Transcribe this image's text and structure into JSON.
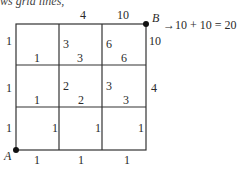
{
  "header_text": "ws grid lines,",
  "points": {
    "start": "A",
    "end": "B"
  },
  "result_text": "→10 + 10 = 20",
  "top_edge_labels": [
    "4",
    "10"
  ],
  "right_edge_labels": [
    "10",
    "4"
  ],
  "left_edge_labels": [
    "1",
    "1",
    "1"
  ],
  "bottom_edge_labels": [
    "1",
    "1",
    "1"
  ],
  "row1": {
    "vertical": [
      "3",
      "6"
    ],
    "horizontal": [
      "1",
      "3",
      "6"
    ]
  },
  "row2": {
    "vertical": [
      "2",
      "3"
    ],
    "horizontal": [
      "1",
      "2",
      "3"
    ]
  },
  "row3": {
    "vertical": [
      "1",
      "1",
      "1"
    ]
  }
}
